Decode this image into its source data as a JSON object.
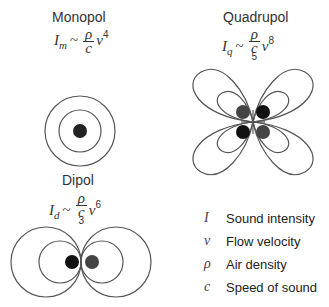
{
  "monopole": {
    "title": "Monopol",
    "formula": {
      "lhs": "I",
      "sub": "m",
      "op": "~",
      "num": "ρ",
      "den": "c",
      "den_exp": "",
      "var": "v",
      "exp": "4"
    }
  },
  "quadrupole": {
    "title": "Quadrupol",
    "formula": {
      "lhs": "I",
      "sub": "q",
      "op": "~",
      "num": "ρ",
      "den": "c",
      "den_exp": "5",
      "var": "v",
      "exp": "8"
    }
  },
  "dipole": {
    "title": "Dipol",
    "formula": {
      "lhs": "I",
      "sub": "d",
      "op": "~",
      "num": "ρ",
      "den": "c",
      "den_exp": "3",
      "var": "v",
      "exp": "6"
    }
  },
  "legend": {
    "items": [
      {
        "symbol": "I",
        "label": "Sound intensity"
      },
      {
        "symbol": "v",
        "label": "Flow velocity"
      },
      {
        "symbol": "ρ",
        "label": "Air density"
      },
      {
        "symbol": "c",
        "label": "Speed of sound"
      }
    ]
  },
  "colors": {
    "line": "#555555",
    "dot_dark": "#111111",
    "dot_gray": "#444444"
  }
}
